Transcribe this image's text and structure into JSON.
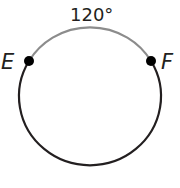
{
  "diagram": {
    "type": "circle-arc",
    "arc_label": "120°",
    "points": [
      {
        "label": "E",
        "position": "left"
      },
      {
        "label": "F",
        "position": "right"
      }
    ],
    "arc_measure_degrees": 120,
    "colors": {
      "minor_arc": "#8c8c8c",
      "major_arc": "#231f20",
      "points": "#000000",
      "text": "#231f20"
    }
  }
}
